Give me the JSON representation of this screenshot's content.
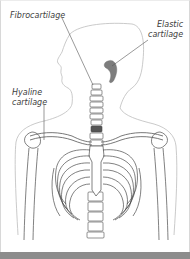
{
  "diagram": {
    "labels": {
      "fibrocartilage": "Fibrocartilage",
      "elastic_line1": "Elastic",
      "elastic_line2": "cartilage",
      "hyaline_line1": "Hyaline",
      "hyaline_line2": "cartilage"
    },
    "colors": {
      "line": "#6a6a6a",
      "outline": "#b8b8b8",
      "ear_fill": "#7a7a7a",
      "label_text": "#3c3c3c",
      "bottom_bar": "#8c8c8c"
    }
  }
}
